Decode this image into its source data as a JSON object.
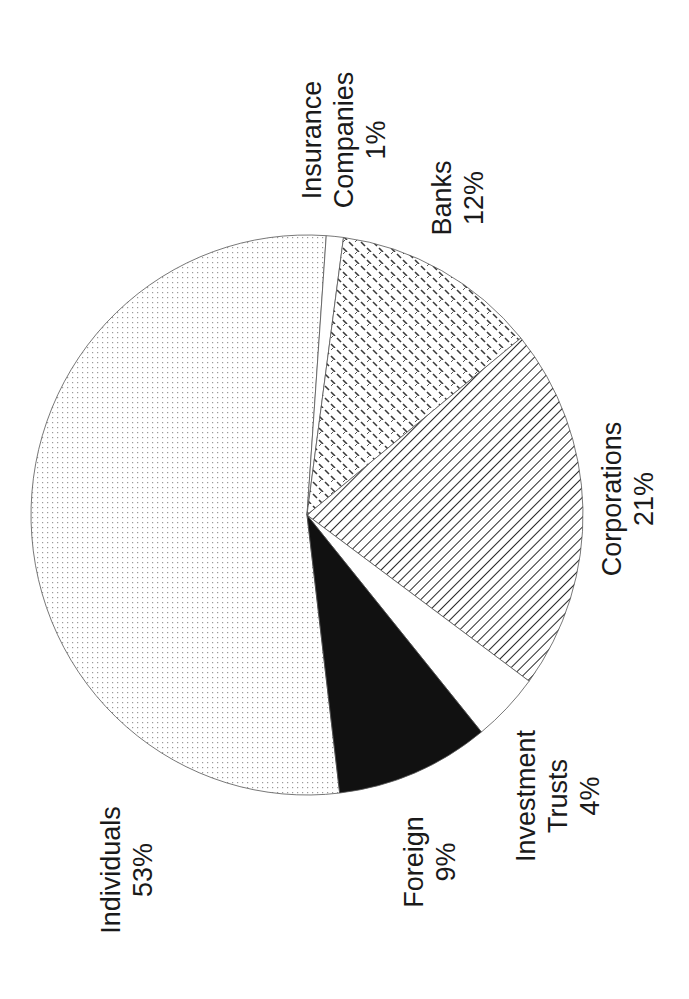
{
  "chart_data": {
    "type": "pie",
    "title": "",
    "orientation": "rotated 90° counter-clockwise (labels read bottom-to-top)",
    "categories": [
      "Individuals",
      "Insurance Companies",
      "Banks",
      "Corporations",
      "Investment Trusts",
      "Foreign"
    ],
    "values": [
      53,
      1,
      12,
      21,
      4,
      9
    ],
    "unit": "%",
    "slices": [
      {
        "label": "Individuals",
        "value": 53,
        "display": "53%",
        "fill": "fine-dot pattern"
      },
      {
        "label": "Insurance Companies",
        "value": 1,
        "display": "1%",
        "fill": "white"
      },
      {
        "label": "Banks",
        "value": 12,
        "display": "12%",
        "fill": "dash-weave pattern"
      },
      {
        "label": "Corporations",
        "value": 21,
        "display": "21%",
        "fill": "diagonal hatch"
      },
      {
        "label": "Investment Trusts",
        "value": 4,
        "display": "4%",
        "fill": "white"
      },
      {
        "label": "Foreign",
        "value": 9,
        "display": "9%",
        "fill": "solid black"
      }
    ],
    "legend": "none (direct labels)"
  },
  "labels": {
    "individuals": {
      "name": "Individuals",
      "pct": "53%"
    },
    "insurance": {
      "name_line1": "Insurance",
      "name_line2": "Companies",
      "pct": "1%"
    },
    "banks": {
      "name": "Banks",
      "pct": "12%"
    },
    "corporations": {
      "name": "Corporations",
      "pct": "21%"
    },
    "investment": {
      "name_line1": "Investment",
      "name_line2": "Trusts",
      "pct": "4%"
    },
    "foreign": {
      "name": "Foreign",
      "pct": "9%"
    }
  },
  "colors": {
    "outline": "#555555",
    "black": "#111111",
    "dot": "#9a9a9a",
    "dash": "#3a3a3a",
    "hatch": "#2a2a2a"
  }
}
